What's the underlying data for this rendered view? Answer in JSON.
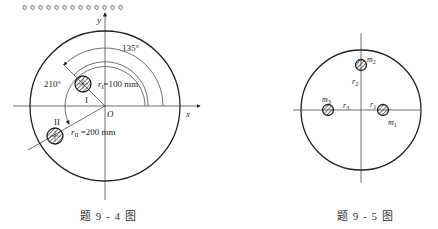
{
  "top_text": "。。。。。。。。。。。。。",
  "figure_9_4": {
    "caption": "题 9 - 4 图",
    "axis_x": "x",
    "axis_y": "y",
    "origin": "O",
    "angle_1": "135°",
    "angle_2": "210°",
    "mass_1_label": "I",
    "mass_2_label": "II",
    "r1_symbol": "r",
    "r1_sub": "I",
    "r1_value": "=100 mm",
    "r2_symbol": "r",
    "r2_sub": "II",
    "r2_value": "=200 mm"
  },
  "figure_9_5": {
    "caption": "题 9 - 5 图",
    "m1": "m",
    "m1_sub": "1",
    "m2": "m",
    "m2_sub": "2",
    "m3": "m",
    "m3_sub": "3",
    "r1": "r",
    "r1_sub": "1",
    "r2": "r",
    "r2_sub": "2",
    "r3": "r",
    "r3_sub": "3"
  }
}
